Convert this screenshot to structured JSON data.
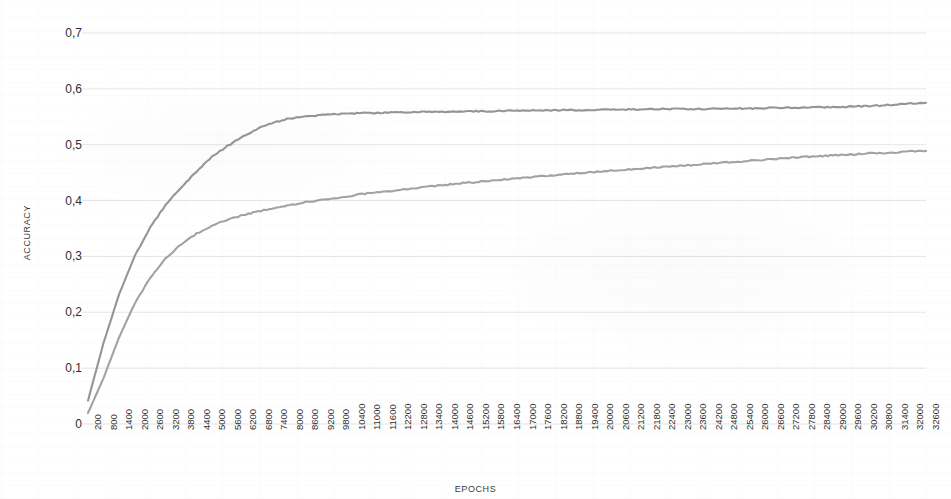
{
  "chart_data": {
    "type": "line",
    "title": "",
    "xlabel": "EPOCHS",
    "ylabel": "ACCURACY",
    "ylim": [
      0,
      0.7
    ],
    "xlim": [
      200,
      32600
    ],
    "grid": true,
    "legend": "none",
    "y_ticks": [
      "0,7",
      "0,6",
      "0,5",
      "0,4",
      "0,3",
      "0,2",
      "0,1",
      "0"
    ],
    "y_tick_values": [
      0.7,
      0.6,
      0.5,
      0.4,
      0.3,
      0.2,
      0.1,
      0
    ],
    "categories": [
      200,
      800,
      1400,
      2000,
      2600,
      3200,
      3800,
      4400,
      5000,
      5600,
      6200,
      6800,
      7400,
      8000,
      8600,
      9200,
      9800,
      10400,
      11000,
      11600,
      12200,
      12800,
      13400,
      14000,
      14600,
      15200,
      15800,
      16400,
      17000,
      17600,
      18200,
      18800,
      19400,
      20000,
      20600,
      21200,
      21800,
      22400,
      23000,
      23600,
      24200,
      24800,
      25400,
      26000,
      26600,
      27200,
      27800,
      28400,
      29000,
      29600,
      30200,
      30800,
      31400,
      32000,
      32600
    ],
    "series": [
      {
        "name": "series-upper",
        "color": "#8c8c8c",
        "values": [
          0.042,
          0.145,
          0.232,
          0.3,
          0.352,
          0.392,
          0.424,
          0.452,
          0.479,
          0.498,
          0.515,
          0.53,
          0.54,
          0.547,
          0.551,
          0.553,
          0.555,
          0.556,
          0.557,
          0.557,
          0.558,
          0.558,
          0.559,
          0.559,
          0.559,
          0.56,
          0.56,
          0.561,
          0.561,
          0.561,
          0.562,
          0.562,
          0.562,
          0.563,
          0.563,
          0.563,
          0.563,
          0.564,
          0.564,
          0.564,
          0.564,
          0.565,
          0.565,
          0.565,
          0.566,
          0.566,
          0.566,
          0.567,
          0.567,
          0.568,
          0.569,
          0.57,
          0.572,
          0.574,
          0.575
        ]
      },
      {
        "name": "series-lower",
        "color": "#9a9a9a",
        "values": [
          0.02,
          0.082,
          0.155,
          0.215,
          0.262,
          0.296,
          0.322,
          0.341,
          0.355,
          0.366,
          0.374,
          0.381,
          0.387,
          0.392,
          0.397,
          0.401,
          0.405,
          0.409,
          0.413,
          0.416,
          0.419,
          0.422,
          0.425,
          0.428,
          0.431,
          0.433,
          0.436,
          0.438,
          0.441,
          0.443,
          0.445,
          0.448,
          0.45,
          0.452,
          0.454,
          0.456,
          0.458,
          0.46,
          0.462,
          0.464,
          0.466,
          0.468,
          0.47,
          0.472,
          0.474,
          0.476,
          0.478,
          0.479,
          0.481,
          0.482,
          0.484,
          0.485,
          0.486,
          0.488,
          0.489
        ]
      }
    ]
  },
  "style": {
    "grid_color": "#e2e2e4",
    "text_color": "#2f2f2f",
    "plot_left": 88,
    "plot_right": 926,
    "plot_top": 33,
    "plot_bottom": 424
  }
}
